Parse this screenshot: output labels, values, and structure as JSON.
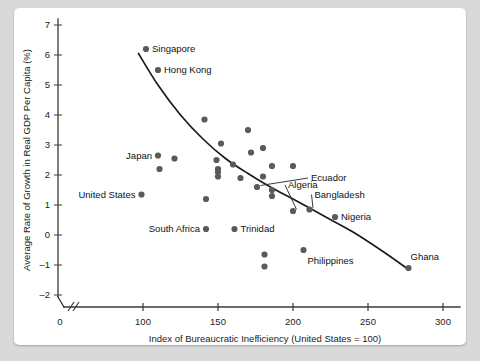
{
  "chart_data": {
    "type": "scatter",
    "title": "",
    "xlabel": "Index of Bureaucratic Inefficiency (United States = 100)",
    "ylabel": "Average Rate of Growth in Real GDP Per Capita (%)",
    "xlim": [
      90,
      305
    ],
    "ylim": [
      -2,
      7
    ],
    "grid": false,
    "legend": "none",
    "x_ticks": [
      0,
      100,
      150,
      200,
      250,
      300
    ],
    "y_ticks": [
      -2,
      -1,
      0,
      1,
      2,
      3,
      4,
      5,
      6,
      7
    ],
    "axis_break_after_x": 0,
    "points": [
      {
        "label": "Singapore",
        "x": 102,
        "y": 6.2,
        "label_pos": "right"
      },
      {
        "label": "Hong Kong",
        "x": 110,
        "y": 5.5,
        "label_pos": "right"
      },
      {
        "label": "Japan",
        "x": 110,
        "y": 2.65,
        "label_pos": "left"
      },
      {
        "label": "United States",
        "x": 99,
        "y": 1.35,
        "label_pos": "left"
      },
      {
        "label": "South Africa",
        "x": 142,
        "y": 0.2,
        "label_pos": "left"
      },
      {
        "label": "Trinidad",
        "x": 161,
        "y": 0.2,
        "label_pos": "right"
      },
      {
        "label": "Ecuador",
        "x": 176,
        "y": 1.6,
        "label_pos": "leader"
      },
      {
        "label": "Algeria",
        "x": 200,
        "y": 0.8,
        "label_pos": "leader"
      },
      {
        "label": "Bangladesh",
        "x": 211,
        "y": 0.85,
        "label_pos": "leader"
      },
      {
        "label": "Nigeria",
        "x": 228,
        "y": 0.6,
        "label_pos": "right"
      },
      {
        "label": "Philippines",
        "x": 207,
        "y": -0.5,
        "label_pos": "below"
      },
      {
        "label": "Ghana",
        "x": 277,
        "y": -1.1,
        "label_pos": "above-right"
      },
      {
        "label": "",
        "x": 121,
        "y": 2.55
      },
      {
        "label": "",
        "x": 111,
        "y": 2.2
      },
      {
        "label": "",
        "x": 141,
        "y": 3.85
      },
      {
        "label": "",
        "x": 152,
        "y": 3.05
      },
      {
        "label": "",
        "x": 149,
        "y": 2.5
      },
      {
        "label": "",
        "x": 150,
        "y": 2.2
      },
      {
        "label": "",
        "x": 150,
        "y": 2.1
      },
      {
        "label": "",
        "x": 150,
        "y": 1.95
      },
      {
        "label": "",
        "x": 160,
        "y": 2.35
      },
      {
        "label": "",
        "x": 165,
        "y": 1.9
      },
      {
        "label": "",
        "x": 170,
        "y": 3.5
      },
      {
        "label": "",
        "x": 172,
        "y": 2.75
      },
      {
        "label": "",
        "x": 180,
        "y": 2.9
      },
      {
        "label": "",
        "x": 180,
        "y": 1.95
      },
      {
        "label": "",
        "x": 186,
        "y": 2.3
      },
      {
        "label": "",
        "x": 186,
        "y": 1.5
      },
      {
        "label": "",
        "x": 186,
        "y": 1.3
      },
      {
        "label": "",
        "x": 142,
        "y": 1.2
      },
      {
        "label": "",
        "x": 181,
        "y": -0.65
      },
      {
        "label": "",
        "x": 181,
        "y": -1.05
      },
      {
        "label": "",
        "x": 200,
        "y": 2.3
      }
    ],
    "trend_curve": {
      "description": "downward-sloping convex fitted curve",
      "points": [
        {
          "x": 97,
          "y": 6.05
        },
        {
          "x": 110,
          "y": 5.0
        },
        {
          "x": 125,
          "y": 4.0
        },
        {
          "x": 140,
          "y": 3.2
        },
        {
          "x": 155,
          "y": 2.55
        },
        {
          "x": 170,
          "y": 2.05
        },
        {
          "x": 185,
          "y": 1.6
        },
        {
          "x": 200,
          "y": 1.2
        },
        {
          "x": 220,
          "y": 0.65
        },
        {
          "x": 240,
          "y": 0.1
        },
        {
          "x": 260,
          "y": -0.55
        },
        {
          "x": 277,
          "y": -1.15
        }
      ]
    }
  }
}
